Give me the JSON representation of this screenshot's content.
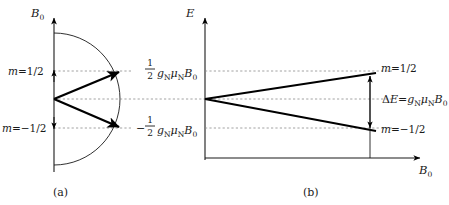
{
  "figure": {
    "panels": [
      {
        "id": "a",
        "caption": "(a)",
        "axis_label": "B0",
        "axis_label_main": "B",
        "axis_label_sub": "0",
        "levels": [
          {
            "name": "m-up",
            "label_m": "m",
            "label_eq": "=1/2",
            "label_full": "m=1/2"
          },
          {
            "name": "m-down",
            "label_m": "m",
            "label_eq": "=−1/2",
            "label_full": "m=−1/2"
          }
        ],
        "description_elements": [
          "semicircle-arc",
          "upper-vector-arrow",
          "lower-vector-arrow",
          "axis-tick-arrow-up",
          "axis-tick-arrow-down"
        ]
      },
      {
        "id": "b",
        "caption": "(b)",
        "y_axis_label": "E",
        "x_axis_label_main": "B",
        "x_axis_label_sub": "0",
        "energy_labels": [
          {
            "name": "upper-energy",
            "sign": "",
            "frac_num": "1",
            "frac_den": "2",
            "g": "g",
            "g_sub": "N",
            "mu": "μ",
            "mu_sub": "N",
            "B": "B",
            "B_sub": "0",
            "full": "1/2 gN μN B0"
          },
          {
            "name": "lower-energy",
            "sign": "−",
            "frac_num": "1",
            "frac_den": "2",
            "g": "g",
            "g_sub": "N",
            "mu": "μ",
            "mu_sub": "N",
            "B": "B",
            "B_sub": "0",
            "full": "−1/2 gN μN B0"
          }
        ],
        "state_labels": [
          {
            "name": "state-m-up",
            "full": "m=1/2",
            "m": "m",
            "rest": "=1/2"
          },
          {
            "name": "state-m-down",
            "full": "m=−1/2",
            "m": "m",
            "rest": "=−1/2"
          }
        ],
        "delta_annotation": {
          "name": "delta-E-annotation",
          "delta": "Δ",
          "E": "E",
          "eq": "=",
          "g": "g",
          "g_sub": "N",
          "mu": "μ",
          "mu_sub": "N",
          "B": "B",
          "B_sub": "0",
          "full": "ΔE = gN μN B0"
        }
      }
    ],
    "colors": {
      "ink": "#1a1a1a",
      "line": "#000000",
      "dashed": "#7a7a7a",
      "background": "#ffffff"
    }
  }
}
